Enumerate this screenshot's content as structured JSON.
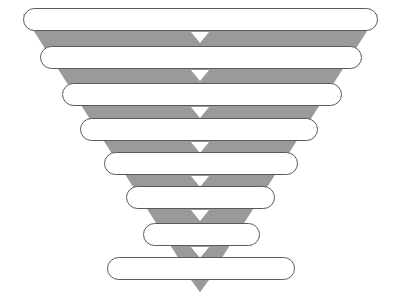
{
  "diagram": {
    "type": "funnel",
    "title": "",
    "orientation": "top-down",
    "width": 397,
    "height": 305,
    "background_color": "#ffffff",
    "funnel_body_color": "#9a9a9a",
    "pill_fill_color": "#ffffff",
    "pill_border_color": "#5a5a5a",
    "chevron_color": "#ffffff",
    "stage_count": 8,
    "chevron_count": 7
  },
  "funnel_body": {
    "top_left_x": 23,
    "top_right_x": 378,
    "top_y": 14,
    "apex_x": 200,
    "apex_y": 292
  },
  "stages": [
    {
      "index": 1,
      "label": "",
      "x": 23,
      "y": 8,
      "width": 355,
      "height": 23
    },
    {
      "index": 2,
      "label": "",
      "x": 40,
      "y": 46,
      "width": 322,
      "height": 23
    },
    {
      "index": 3,
      "label": "",
      "x": 62,
      "y": 83,
      "width": 280,
      "height": 23
    },
    {
      "index": 4,
      "label": "",
      "x": 80,
      "y": 118,
      "width": 238,
      "height": 23
    },
    {
      "index": 5,
      "label": "",
      "x": 104,
      "y": 152,
      "width": 194,
      "height": 23
    },
    {
      "index": 6,
      "label": "",
      "x": 126,
      "y": 186,
      "width": 149,
      "height": 23
    },
    {
      "index": 7,
      "label": "",
      "x": 143,
      "y": 223,
      "width": 117,
      "height": 23
    },
    {
      "index": 8,
      "label": "",
      "x": 107,
      "y": 257,
      "width": 188,
      "height": 23
    }
  ],
  "chevrons": [
    {
      "index": 1,
      "center_x": 200,
      "top_y": 32,
      "half_width": 9,
      "height": 11
    },
    {
      "index": 2,
      "center_x": 200,
      "top_y": 70,
      "half_width": 9,
      "height": 11
    },
    {
      "index": 3,
      "center_x": 200,
      "top_y": 107,
      "half_width": 9,
      "height": 11
    },
    {
      "index": 4,
      "center_x": 200,
      "top_y": 142,
      "half_width": 9,
      "height": 11
    },
    {
      "index": 5,
      "center_x": 200,
      "top_y": 176,
      "half_width": 9,
      "height": 11
    },
    {
      "index": 6,
      "center_x": 200,
      "top_y": 210,
      "half_width": 9,
      "height": 11
    },
    {
      "index": 7,
      "center_x": 200,
      "top_y": 247,
      "half_width": 9,
      "height": 11
    }
  ],
  "apex_tip": {
    "center_x": 200,
    "top_y": 280,
    "half_width": 9,
    "bottom_y": 292
  }
}
